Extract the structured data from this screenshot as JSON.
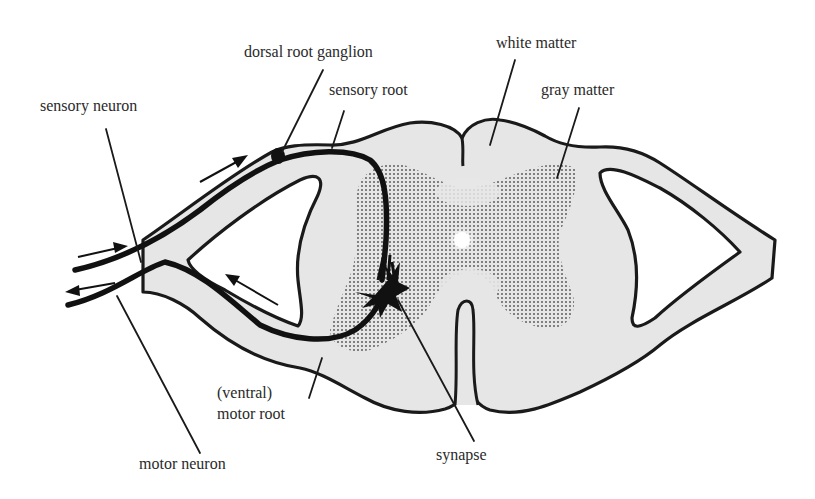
{
  "diagram": {
    "labels": {
      "dorsal_root_ganglion": "dorsal root ganglion",
      "sensory_root": "sensory root",
      "white_matter": "white matter",
      "gray_matter": "gray matter",
      "sensory_neuron": "sensory neuron",
      "ventral_line1": "(ventral)",
      "ventral_line2": "motor root",
      "motor_neuron": "motor neuron",
      "synapse": "synapse"
    },
    "colors": {
      "white_matter_fill": "#e6e6e6",
      "gray_matter_dots": "#555555",
      "outline": "#1a1a1a",
      "background": "#ffffff"
    },
    "arrows": [
      {
        "name": "sensory-inflow-upper",
        "direction": "toward-cord"
      },
      {
        "name": "sensory-inflow-left",
        "direction": "toward-cord"
      },
      {
        "name": "motor-outflow-inner",
        "direction": "away-from-cord"
      },
      {
        "name": "motor-outflow-left",
        "direction": "away-from-cord"
      }
    ]
  }
}
